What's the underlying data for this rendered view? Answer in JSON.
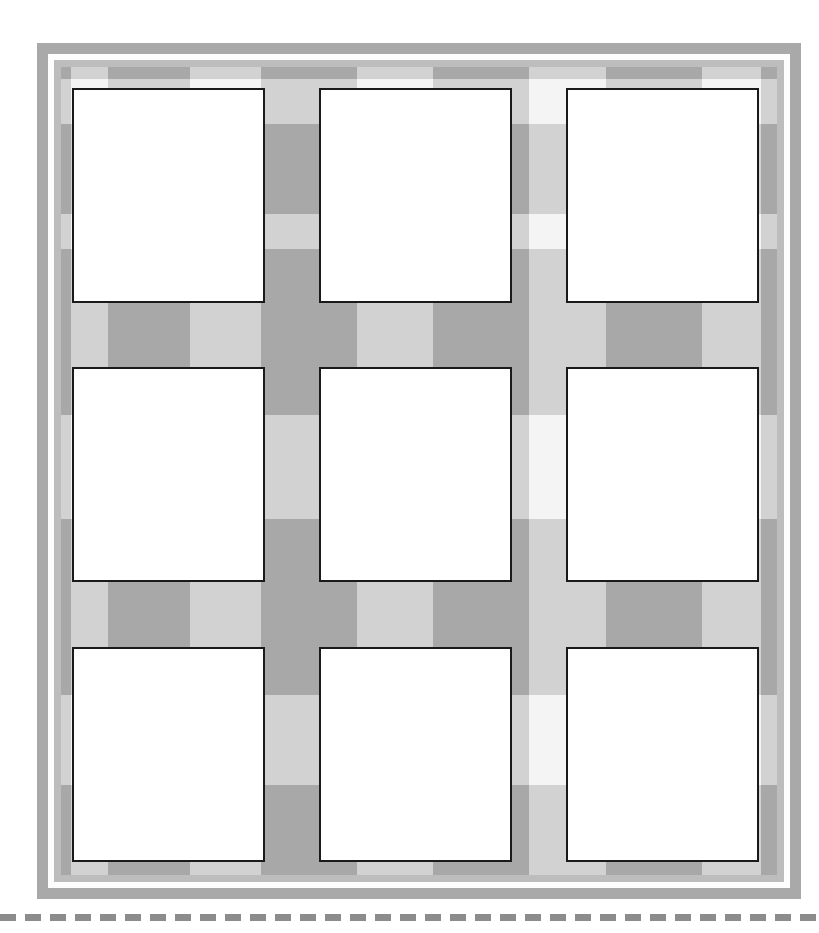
{
  "sheet": {
    "title": "Blank Card Grid Sheet",
    "description": "Scanned worksheet showing a three by three grid of blank white cards on a gray gingham plaid background",
    "orientation": "portrait",
    "page_width": 819,
    "page_height": 933
  },
  "colors": {
    "page_background": "#ffffff",
    "outer_frame": "#a9a9a9",
    "frame_gap": "#fdfdfd",
    "inner_frame": "#bdbdbd",
    "plaid_base": "#f4f4f4",
    "plaid_band": "#d2d2d2",
    "plaid_intersection": "#a8a8a8",
    "card_fill": "#ffffff",
    "card_border": "#1a1a1a",
    "cut_line": "#8c8c8c"
  },
  "frame": {
    "outer": {
      "x": 37,
      "y": 43,
      "width": 764,
      "height": 856
    },
    "gap": {
      "x": 48,
      "y": 54,
      "width": 742,
      "height": 834
    },
    "inner": {
      "x": 54,
      "y": 60,
      "width": 730,
      "height": 822
    },
    "sheet": {
      "x": 61,
      "y": 67,
      "width": 716,
      "height": 808
    }
  },
  "plaid": {
    "horizontal_bands": [
      {
        "top": 0,
        "height": 12
      },
      {
        "top": 57,
        "height": 90
      },
      {
        "top": 182,
        "height": 90
      },
      {
        "top": 248,
        "height": 100
      },
      {
        "top": 452,
        "height": 96
      },
      {
        "top": 528,
        "height": 100
      },
      {
        "top": 718,
        "height": 96
      }
    ],
    "vertical_bands": [
      {
        "left": 0,
        "width": 10
      },
      {
        "left": 47,
        "width": 82
      },
      {
        "left": 200,
        "width": 96
      },
      {
        "left": 372,
        "width": 96
      },
      {
        "left": 545,
        "width": 96
      },
      {
        "left": 700,
        "width": 16
      }
    ]
  },
  "grid": {
    "rows": 3,
    "columns": 3,
    "card_count": 9,
    "card_width": 193,
    "card_height": 215,
    "column_x": [
      72,
      319,
      566
    ],
    "row_y": [
      88,
      367,
      647
    ],
    "cards": [
      {
        "index": 1,
        "row": 1,
        "column": 1,
        "label": "card-r1c1",
        "content": ""
      },
      {
        "index": 2,
        "row": 1,
        "column": 2,
        "label": "card-r1c2",
        "content": ""
      },
      {
        "index": 3,
        "row": 1,
        "column": 3,
        "label": "card-r1c3",
        "content": ""
      },
      {
        "index": 4,
        "row": 2,
        "column": 1,
        "label": "card-r2c1",
        "content": ""
      },
      {
        "index": 5,
        "row": 2,
        "column": 2,
        "label": "card-r2c2",
        "content": ""
      },
      {
        "index": 6,
        "row": 2,
        "column": 3,
        "label": "card-r2c3",
        "content": ""
      },
      {
        "index": 7,
        "row": 3,
        "column": 1,
        "label": "card-r3c1",
        "content": ""
      },
      {
        "index": 8,
        "row": 3,
        "column": 2,
        "label": "card-r3c2",
        "content": ""
      },
      {
        "index": 9,
        "row": 3,
        "column": 3,
        "label": "card-r3c3",
        "content": ""
      }
    ]
  },
  "cut_line": {
    "label": "cut-here-dashed-line",
    "dash_length": 16,
    "dash_gap": 9,
    "thickness": 7,
    "y": 914,
    "count": 33
  }
}
